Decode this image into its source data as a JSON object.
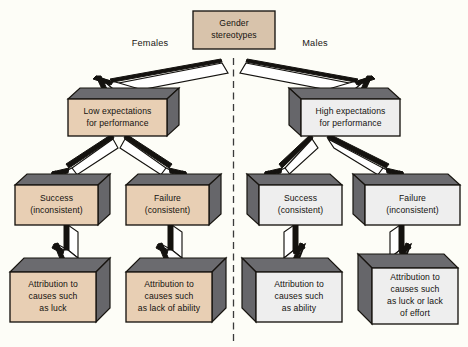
{
  "figure": {
    "background_color": "#fdfdf7",
    "box_fill_left": "#e8cfb4",
    "box_fill_right": "#eeeeee",
    "box_shade": "#66666a",
    "outline_color": "#17140f",
    "divider": {
      "name": "center-dashed-divider",
      "style": "dashed",
      "orientation": "vertical"
    }
  },
  "branch_labels": {
    "left": "Females",
    "right": "Males"
  },
  "nodes": {
    "root": {
      "id": "gender-stereotypes",
      "lines": [
        "Gender",
        "stereotypes"
      ],
      "style": "flat-tan"
    },
    "left_expectation": {
      "id": "low-expectations",
      "lines": [
        "Low expectations",
        "for performance"
      ],
      "style": "3d-tan-right"
    },
    "right_expectation": {
      "id": "high-expectations",
      "lines": [
        "High expectations",
        "for performance"
      ],
      "style": "3d-white-left"
    },
    "left_outcome_a": {
      "id": "female-success",
      "lines": [
        "Success",
        "(inconsistent)"
      ],
      "style": "3d-tan-right"
    },
    "left_outcome_b": {
      "id": "female-failure",
      "lines": [
        "Failure",
        "(consistent)"
      ],
      "style": "3d-tan-right"
    },
    "right_outcome_a": {
      "id": "male-success",
      "lines": [
        "Success",
        "(consistent)"
      ],
      "style": "3d-white-left"
    },
    "right_outcome_b": {
      "id": "male-failure",
      "lines": [
        "Failure",
        "(inconsistent)"
      ],
      "style": "3d-white-left"
    },
    "left_attribution_a": {
      "id": "attribution-luck",
      "lines": [
        "Attribution to",
        "causes such",
        "as luck"
      ],
      "style": "3d-tan-right"
    },
    "left_attribution_b": {
      "id": "attribution-lack-of-ability",
      "lines": [
        "Attribution to",
        "causes such",
        "as lack of ability"
      ],
      "style": "3d-tan-right"
    },
    "right_attribution_a": {
      "id": "attribution-ability",
      "lines": [
        "Attribution to",
        "causes such",
        "as ability"
      ],
      "style": "3d-white-left"
    },
    "right_attribution_b": {
      "id": "attribution-luck-or-lack-of-effort",
      "lines": [
        "Attribution to",
        "causes such",
        "as luck or lack",
        "of effort"
      ],
      "style": "3d-white-left"
    }
  },
  "edges": [
    {
      "from": "gender-stereotypes",
      "to": "low-expectations",
      "label": "Females"
    },
    {
      "from": "gender-stereotypes",
      "to": "high-expectations",
      "label": "Males"
    },
    {
      "from": "low-expectations",
      "to": "female-success",
      "label": ""
    },
    {
      "from": "low-expectations",
      "to": "female-failure",
      "label": ""
    },
    {
      "from": "high-expectations",
      "to": "male-success",
      "label": ""
    },
    {
      "from": "high-expectations",
      "to": "male-failure",
      "label": ""
    },
    {
      "from": "female-success",
      "to": "attribution-luck",
      "label": ""
    },
    {
      "from": "female-failure",
      "to": "attribution-lack-of-ability",
      "label": ""
    },
    {
      "from": "male-success",
      "to": "attribution-ability",
      "label": ""
    },
    {
      "from": "male-failure",
      "to": "attribution-luck-or-lack-of-effort",
      "label": ""
    }
  ]
}
